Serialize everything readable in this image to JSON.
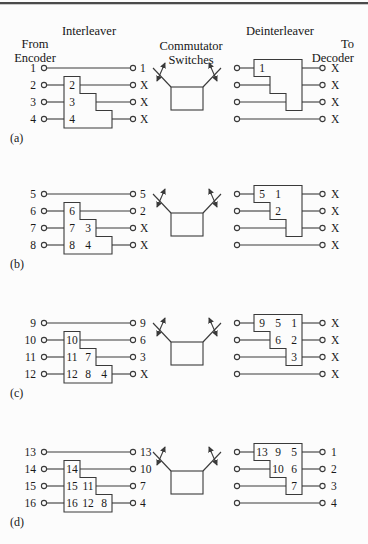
{
  "header": {
    "interleaver": "Interleaver",
    "from_encoder_line1": "From",
    "from_encoder_line2": "Encoder",
    "commutator_line1": "Commutator",
    "commutator_line2": "Switches",
    "deinterleaver": "Deinterleaver",
    "to_decoder_line1": "To",
    "to_decoder_line2": "Decoder"
  },
  "groups": [
    {
      "label": "(a)",
      "inputs": [
        "1",
        "2",
        "3",
        "4"
      ],
      "interleaver_cells": [
        [],
        [
          "2"
        ],
        [
          "3",
          ""
        ],
        [
          "4",
          "",
          ""
        ]
      ],
      "interleaver_outputs": [
        "1",
        "X",
        "X",
        "X"
      ],
      "deinterleaver_cells": [
        [
          "1",
          "",
          ""
        ],
        [
          "",
          ""
        ],
        [
          ""
        ],
        []
      ],
      "deinterleaver_outputs": [
        "X",
        "X",
        "X",
        "X"
      ]
    },
    {
      "label": "(b)",
      "inputs": [
        "5",
        "6",
        "7",
        "8"
      ],
      "interleaver_cells": [
        [],
        [
          "6"
        ],
        [
          "7",
          "3"
        ],
        [
          "8",
          "4",
          ""
        ]
      ],
      "interleaver_outputs": [
        "5",
        "2",
        "X",
        "X"
      ],
      "deinterleaver_cells": [
        [
          "5",
          "1",
          ""
        ],
        [
          "2",
          ""
        ],
        [
          ""
        ],
        []
      ],
      "deinterleaver_outputs": [
        "X",
        "X",
        "X",
        "X"
      ]
    },
    {
      "label": "(c)",
      "inputs": [
        "9",
        "10",
        "11",
        "12"
      ],
      "interleaver_cells": [
        [],
        [
          "10"
        ],
        [
          "11",
          "7"
        ],
        [
          "12",
          "8",
          "4"
        ]
      ],
      "interleaver_outputs": [
        "9",
        "6",
        "3",
        "X"
      ],
      "deinterleaver_cells": [
        [
          "9",
          "5",
          "1"
        ],
        [
          "6",
          "2"
        ],
        [
          "3"
        ],
        []
      ],
      "deinterleaver_outputs": [
        "X",
        "X",
        "X",
        "X"
      ]
    },
    {
      "label": "(d)",
      "inputs": [
        "13",
        "14",
        "15",
        "16"
      ],
      "interleaver_cells": [
        [],
        [
          "14"
        ],
        [
          "15",
          "11"
        ],
        [
          "16",
          "12",
          "8"
        ]
      ],
      "interleaver_outputs": [
        "13",
        "10",
        "7",
        "4"
      ],
      "deinterleaver_cells": [
        [
          "13",
          "9",
          "5"
        ],
        [
          "10",
          "6"
        ],
        [
          "7"
        ],
        []
      ],
      "deinterleaver_outputs": [
        "1",
        "2",
        "3",
        "4"
      ]
    }
  ],
  "colors": {
    "line": "#3a3a3a",
    "text": "#191919",
    "background": "#fcfcfc",
    "top_rule": "#4a4a4a"
  }
}
